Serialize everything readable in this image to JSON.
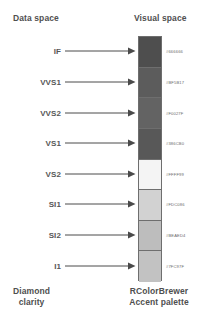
{
  "headers": {
    "data_space": "Data space",
    "visual_space": "Visual space"
  },
  "captions": {
    "data_line1": "Diamond",
    "data_line2": "clarity",
    "visual_line1": "RColorBrewer",
    "visual_line2": "Accent palette"
  },
  "mappings": [
    {
      "category": "IF",
      "hex": "#666666",
      "swatch_render": "#4e4e4e"
    },
    {
      "category": "VVS1",
      "hex": "#BF5B17",
      "swatch_render": "#5c5c5c"
    },
    {
      "category": "VVS2",
      "hex": "#F0027F",
      "swatch_render": "#636363"
    },
    {
      "category": "VS1",
      "hex": "#386CB0",
      "swatch_render": "#585858"
    },
    {
      "category": "VS2",
      "hex": "#FFFF99",
      "swatch_render": "#f4f4f4"
    },
    {
      "category": "SI1",
      "hex": "#FDC086",
      "swatch_render": "#d2d2d2"
    },
    {
      "category": "SI2",
      "hex": "#BEAED4",
      "swatch_render": "#bdbdbd"
    },
    {
      "category": "I1",
      "hex": "#7FC97F",
      "swatch_render": "#c2c2c2"
    }
  ],
  "icons": {
    "arrow": "arrow-right-icon"
  },
  "colors": {
    "text": "#4f4f4f",
    "arrow": "#4a4a4a",
    "swatch_border": "#6e6e6e",
    "background": "#ffffff"
  }
}
